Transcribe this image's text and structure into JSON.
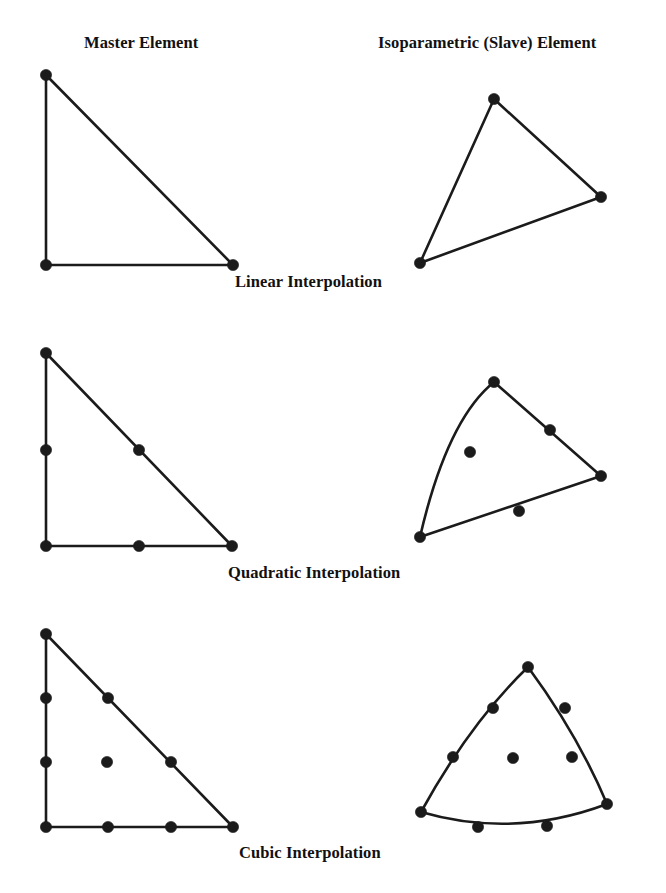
{
  "figure": {
    "background_color": "#ffffff",
    "ink_color": "#1b1b1b"
  },
  "headers": {
    "master": "Master Element",
    "slave": "Isoparametric (Slave) Element"
  },
  "captions": {
    "linear": "Linear Interpolation",
    "quadratic": "Quadratic Interpolation",
    "cubic": "Cubic Interpolation"
  },
  "rows": [
    {
      "id": "linear",
      "caption": "Linear Interpolation",
      "node_count": 3,
      "master": {
        "shape": "right-triangle",
        "edges_curved": false,
        "vertices": [
          [
            46,
            75
          ],
          [
            46,
            265
          ],
          [
            233,
            265
          ]
        ],
        "nodes": [
          [
            46,
            75
          ],
          [
            46,
            265
          ],
          [
            233,
            265
          ]
        ]
      },
      "slave": {
        "shape": "skewed-triangle",
        "edges_curved": false,
        "vertices": [
          [
            494,
            99
          ],
          [
            420,
            263
          ],
          [
            601,
            197
          ]
        ],
        "nodes": [
          [
            494,
            99
          ],
          [
            420,
            263
          ],
          [
            601,
            197
          ]
        ]
      }
    },
    {
      "id": "quadratic",
      "caption": "Quadratic Interpolation",
      "node_count": 6,
      "master": {
        "shape": "right-triangle",
        "edges_curved": false,
        "vertices": [
          [
            46,
            353
          ],
          [
            46,
            546
          ],
          [
            232,
            546
          ]
        ],
        "nodes": [
          [
            46,
            353
          ],
          [
            46,
            546
          ],
          [
            232,
            546
          ],
          [
            46,
            450
          ],
          [
            139,
            546
          ],
          [
            139,
            450
          ]
        ]
      },
      "slave": {
        "shape": "curved-triangle",
        "edges_curved": true,
        "vertices": [
          [
            494,
            382
          ],
          [
            420,
            537
          ],
          [
            601,
            476
          ]
        ],
        "nodes": [
          [
            494,
            382
          ],
          [
            420,
            537
          ],
          [
            601,
            476
          ],
          [
            472,
            450
          ],
          [
            532,
            518
          ],
          [
            552,
            430
          ]
        ]
      }
    },
    {
      "id": "cubic",
      "caption": "Cubic Interpolation",
      "node_count": 10,
      "master": {
        "shape": "right-triangle",
        "edges_curved": false,
        "vertices": [
          [
            46,
            634
          ],
          [
            46,
            827
          ],
          [
            233,
            827
          ]
        ],
        "nodes": [
          [
            46,
            634
          ],
          [
            46,
            827
          ],
          [
            233,
            827
          ],
          [
            46,
            698
          ],
          [
            46,
            762
          ],
          [
            108,
            827
          ],
          [
            171,
            827
          ],
          [
            171,
            762
          ],
          [
            108,
            698
          ],
          [
            107,
            762
          ]
        ]
      },
      "slave": {
        "shape": "curved-triangle",
        "edges_curved": true,
        "vertices": [
          [
            528,
            667
          ],
          [
            421,
            812
          ],
          [
            607,
            804
          ]
        ],
        "nodes": [
          [
            528,
            667
          ],
          [
            421,
            812
          ],
          [
            607,
            804
          ],
          [
            493,
            708
          ],
          [
            453,
            757
          ],
          [
            511,
            826
          ],
          [
            573,
            825
          ],
          [
            572,
            757
          ],
          [
            565,
            708
          ],
          [
            513,
            758
          ]
        ]
      }
    }
  ],
  "node_style": {
    "marker": "filled-circle",
    "radius": 5.6,
    "color": "#1b1b1b"
  }
}
